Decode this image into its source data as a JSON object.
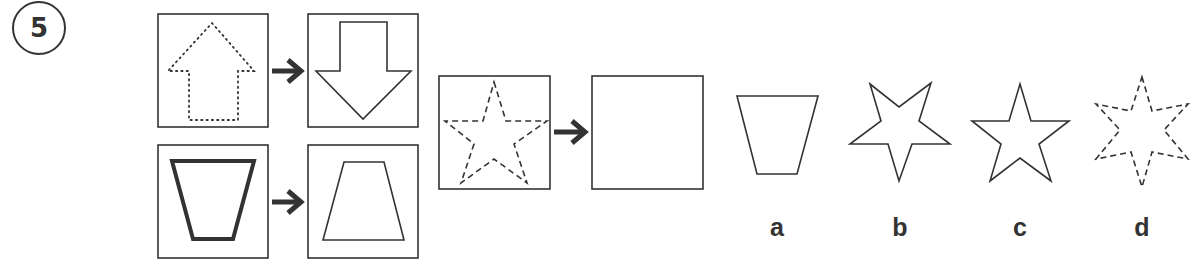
{
  "problem": {
    "number": "5",
    "examples": [
      {
        "from": "dotted-up-arrow",
        "to": "solid-down-arrow"
      },
      {
        "from": "bold-inverted-trapezoid",
        "to": "thin-upright-trapezoid"
      }
    ],
    "question": {
      "from": "dashed-five-point-star",
      "to": "empty"
    },
    "options": [
      {
        "label": "a",
        "shape": "inverted-trapezoid"
      },
      {
        "label": "b",
        "shape": "inverted-five-point-star"
      },
      {
        "label": "c",
        "shape": "five-point-star"
      },
      {
        "label": "d",
        "shape": "dashed-six-point-star"
      }
    ]
  },
  "colors": {
    "stroke": "#333333",
    "background": "#ffffff"
  }
}
